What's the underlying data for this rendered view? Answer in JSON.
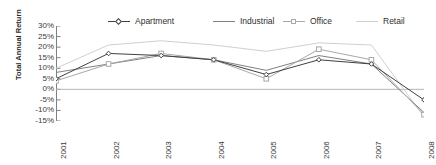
{
  "chart_data": {
    "type": "line",
    "title": "",
    "xlabel": "",
    "ylabel": "Total Annual Return",
    "categories": [
      "2001",
      "2002",
      "2003",
      "2004",
      "2005",
      "2006",
      "2007",
      "2008"
    ],
    "ylim": [
      -15,
      30
    ],
    "ytick_labels": [
      "30%",
      "25%",
      "20%",
      "15%",
      "10%",
      "5%",
      "0%",
      "-5%",
      "-10%",
      "-15%"
    ],
    "ytick_values": [
      30,
      25,
      20,
      15,
      10,
      5,
      0,
      -5,
      -10,
      -15
    ],
    "grid": false,
    "legend_position": "top",
    "series": [
      {
        "name": "Apartment",
        "color": "#404040",
        "marker": "diamond",
        "values": [
          5,
          17,
          16,
          14,
          7,
          14,
          12,
          -5
        ]
      },
      {
        "name": "Industrial",
        "color": "#808080",
        "marker": "none",
        "values": [
          8,
          12,
          16,
          14,
          9,
          16,
          12,
          -11
        ]
      },
      {
        "name": "Office",
        "color": "#a8a8a8",
        "marker": "square",
        "values": [
          4,
          12,
          17,
          14,
          5,
          19,
          14,
          -12
        ]
      },
      {
        "name": "Retail",
        "color": "#d0d0d0",
        "marker": "none",
        "values": [
          10,
          21,
          23,
          21,
          18,
          22,
          21,
          -13
        ]
      }
    ]
  },
  "axis": {
    "y_title": "Total Annual Return"
  }
}
